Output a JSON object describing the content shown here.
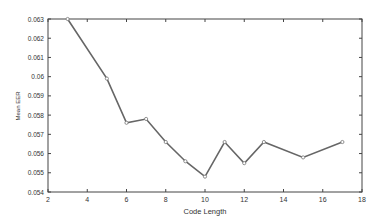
{
  "chart_data": {
    "type": "line",
    "title": "",
    "xlabel": "Code Length",
    "ylabel": "Mean EER",
    "xlim": [
      2,
      18
    ],
    "ylim": [
      0.054,
      0.063
    ],
    "xticks": [
      2,
      4,
      6,
      8,
      10,
      12,
      14,
      16,
      18
    ],
    "yticks": [
      0.054,
      0.055,
      0.056,
      0.057,
      0.058,
      0.059,
      0.06,
      0.061,
      0.062,
      0.063
    ],
    "ytick_labels": [
      "0.054",
      "0.055",
      "0.056",
      "0.057",
      "0.058",
      "0.059",
      "0.06",
      "0.061",
      "0.062",
      "0.063"
    ],
    "grid": false,
    "legend": null,
    "series": [
      {
        "name": "Mean EER",
        "x": [
          3,
          5,
          6,
          7,
          8,
          9,
          10,
          11,
          12,
          13,
          15,
          17
        ],
        "values": [
          0.063,
          0.0599,
          0.0576,
          0.0578,
          0.0566,
          0.0556,
          0.0548,
          0.0566,
          0.0555,
          0.0566,
          0.0558,
          0.0566
        ]
      }
    ]
  }
}
